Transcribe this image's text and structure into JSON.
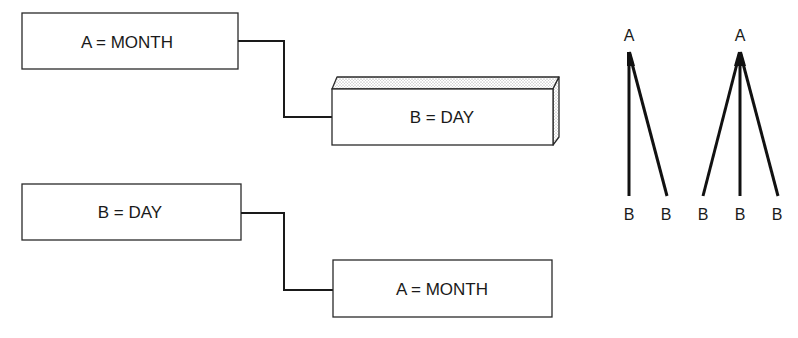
{
  "diagram": {
    "pairs": [
      {
        "parent": {
          "label": "A = MONTH",
          "style": "flat"
        },
        "child": {
          "label": "B = DAY",
          "style": "3d-slab"
        }
      },
      {
        "parent": {
          "label": "B = DAY",
          "style": "flat"
        },
        "child": {
          "label": "A = MONTH",
          "style": "flat"
        }
      }
    ],
    "trees": [
      {
        "root": "A",
        "leaves": [
          "B",
          "B"
        ]
      },
      {
        "root": "A",
        "leaves": [
          "B",
          "B",
          "B"
        ]
      }
    ],
    "colors": {
      "stroke": "#1a1a1a",
      "background": "#ffffff",
      "stipple": "#9a9a9a"
    }
  }
}
